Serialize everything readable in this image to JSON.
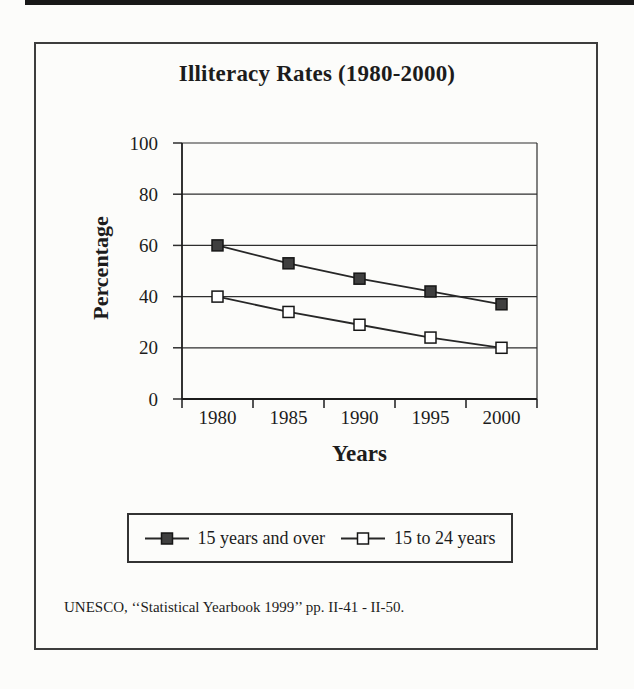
{
  "chart_data": {
    "type": "line",
    "title": "Illiteracy Rates (1980-2000)",
    "xlabel": "Years",
    "ylabel": "Percentage",
    "categories": [
      "1980",
      "1985",
      "1990",
      "1995",
      "2000"
    ],
    "series": [
      {
        "name": "15 years and over",
        "marker": "filled-square",
        "marker_fill": "#3f3f3f",
        "values": [
          60,
          53,
          47,
          42,
          37
        ]
      },
      {
        "name": "15 to 24 years",
        "marker": "open-square",
        "marker_fill": "#ffffff",
        "values": [
          40,
          34,
          29,
          24,
          20
        ]
      }
    ],
    "ylim": [
      0,
      100
    ],
    "yticks": [
      0,
      20,
      40,
      60,
      80,
      100
    ],
    "grid": "horizontal",
    "legend_position": "bottom"
  },
  "source_note": "UNESCO, ‘‘Statistical Yearbook 1999’’ pp. II-41 - II-50.",
  "colors": {
    "ink": "#1c1c1c",
    "line": "#272727",
    "grid": "#2e2e2e",
    "marker_stroke": "#161616",
    "frame": "#3d3d3d",
    "scan_bar": "#181818"
  }
}
